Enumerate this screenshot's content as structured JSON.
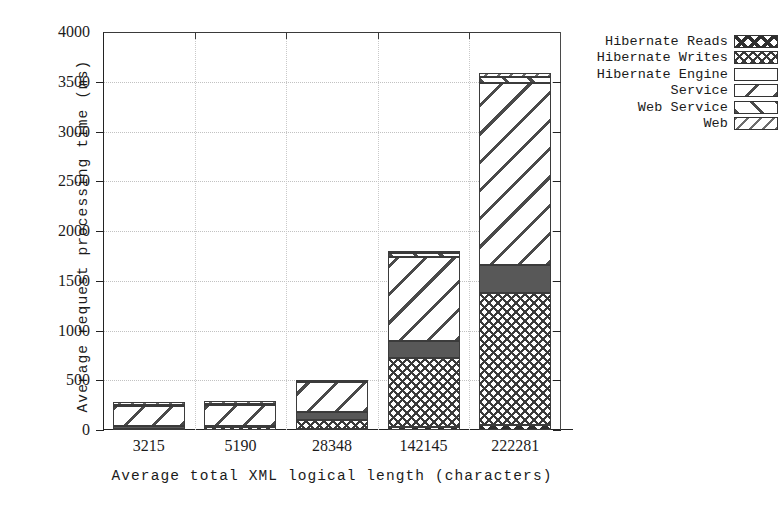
{
  "chart_data": {
    "type": "bar",
    "subtype": "stacked-bar",
    "title": "",
    "xlabel": "Average total XML logical length (characters)",
    "ylabel": "Average request processing time (ms)",
    "categories": [
      "3215",
      "5190",
      "28348",
      "142145",
      "222281"
    ],
    "ylim": [
      0,
      4000
    ],
    "ytick_values": [
      0,
      500,
      1000,
      1500,
      2000,
      2500,
      3000,
      3500,
      4000
    ],
    "ytick_labels": [
      "0",
      "500",
      "1000",
      "1500",
      "2000",
      "2500",
      "3000",
      "3500",
      "4000"
    ],
    "grid": true,
    "legend_position": "right-top",
    "stack_order_bottom_to_top": [
      "Hibernate Reads",
      "Hibernate Writes",
      "Hibernate Engine",
      "Service",
      "Web Service",
      "Web"
    ],
    "series": [
      {
        "name": "Hibernate Reads",
        "pattern": "bold-x",
        "values": [
          5,
          5,
          8,
          30,
          55
        ]
      },
      {
        "name": "Hibernate Writes",
        "pattern": "fine-crosshatch",
        "values": [
          10,
          12,
          95,
          690,
          1320
        ]
      },
      {
        "name": "Hibernate Engine",
        "pattern": "solid-dark-gray",
        "values": [
          25,
          28,
          75,
          170,
          280
        ]
      },
      {
        "name": "Service",
        "pattern": "wide-backslash",
        "values": [
          205,
          210,
          300,
          850,
          1830
        ]
      },
      {
        "name": "Web Service",
        "pattern": "wide-forwardslash",
        "values": [
          10,
          10,
          6,
          35,
          60
        ]
      },
      {
        "name": "Web",
        "pattern": "fine-diagonal",
        "values": [
          10,
          10,
          6,
          25,
          45
        ]
      }
    ],
    "totals": [
      265,
      275,
      490,
      1800,
      3590
    ]
  },
  "legend": {
    "items": [
      {
        "label": "Hibernate Reads",
        "swatch": "bold-x-pattern-swatch"
      },
      {
        "label": "Hibernate Writes",
        "swatch": "crosshatch-pattern-swatch"
      },
      {
        "label": "Hibernate Engine",
        "swatch": "solid-dark-swatch"
      },
      {
        "label": "Service",
        "swatch": "backslash-pattern-swatch"
      },
      {
        "label": "Web Service",
        "swatch": "forwardslash-pattern-swatch"
      },
      {
        "label": "Web",
        "swatch": "fine-diagonal-pattern-swatch"
      }
    ]
  },
  "colors": {
    "background": "#ffffff",
    "axis": "#232323",
    "grid": "#c2c2c2",
    "hatch": "#3a3a3a",
    "engine_fill": "#585858"
  }
}
